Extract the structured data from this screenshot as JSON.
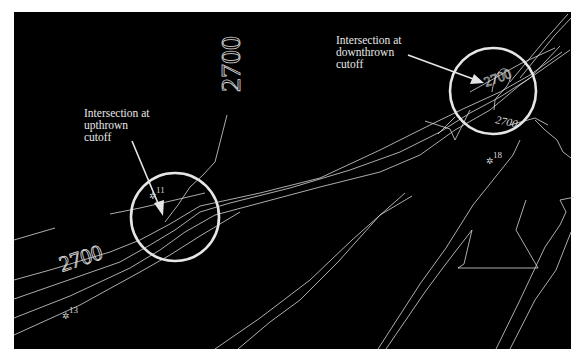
{
  "diagram": {
    "background_color": "#000000",
    "line_color": "#d8d8d8",
    "annotations": [
      {
        "id": "upthrown",
        "text": "Intersection at\nupthrown\ncutoff"
      },
      {
        "id": "downthrown",
        "text": "Intersection at\ndownthrown\ncutoff"
      }
    ],
    "contour_labels": [
      {
        "text": "2700",
        "position": "top-center-vertical"
      },
      {
        "text": "2700",
        "position": "left-along-fault"
      },
      {
        "text": "2700",
        "position": "right-circle-small"
      },
      {
        "text": "2700",
        "position": "right-circle-inside"
      }
    ],
    "wells": [
      {
        "label": "11"
      },
      {
        "label": "13"
      },
      {
        "label": "18"
      }
    ]
  }
}
